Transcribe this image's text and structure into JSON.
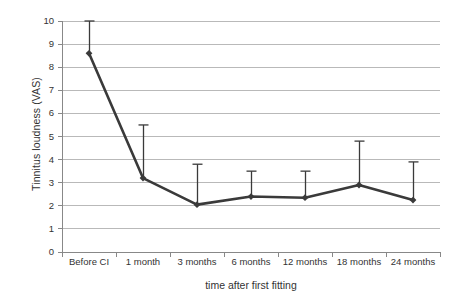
{
  "chart_data": {
    "type": "line",
    "title": "",
    "xlabel": "time after first fitting",
    "ylabel": "Tinnitus loudness (VAS)",
    "categories": [
      "Before CI",
      "1 month",
      "3 months",
      "6 months",
      "12 months",
      "18 months",
      "24 months"
    ],
    "values": [
      8.6,
      3.2,
      2.05,
      2.4,
      2.35,
      2.9,
      2.25
    ],
    "error_upper": [
      10.0,
      5.5,
      3.8,
      3.5,
      3.5,
      4.8,
      3.9
    ],
    "ylim": [
      0,
      10
    ],
    "yticks": [
      0,
      1,
      2,
      3,
      4,
      5,
      6,
      7,
      8,
      9,
      10
    ],
    "ytick_labels": [
      "0",
      "1",
      "2",
      "3",
      "4",
      "5",
      "6",
      "7",
      "8",
      "9",
      "10"
    ],
    "grid": "horizontal",
    "legend": "none",
    "series_color": "#3a3a3a",
    "grid_color": "#b9b9b9",
    "axis_color": "#888888",
    "marker": "diamond",
    "error_bar_direction": "up"
  }
}
